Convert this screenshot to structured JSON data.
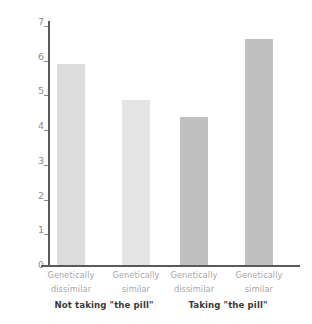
{
  "chart_data": {
    "type": "bar",
    "title": "",
    "xlabel": "",
    "ylabel": "Rated attractiveness of male odors",
    "ylim": [
      0,
      7
    ],
    "yticks": [
      "0",
      "1",
      "2",
      "3",
      "4",
      "5",
      "6",
      "7"
    ],
    "grid": false,
    "legend": "none",
    "categories": [
      "Genetically dissimilar",
      "Genetically similar",
      "Genetically dissimilar",
      "Genetically similar"
    ],
    "values": [
      5.8,
      4.75,
      4.25,
      6.5
    ],
    "bar_colors": [
      "#dcdcdc",
      "#e4e4e4",
      "#c0c0c0",
      "#c0c0c0"
    ],
    "groups": [
      {
        "label": "Not taking \"the pill\"",
        "categories": [
          "Genetically dissimilar",
          "Genetically similar"
        ]
      },
      {
        "label": "Taking \"the pill\"",
        "categories": [
          "Genetically dissimilar",
          "Genetically similar"
        ]
      }
    ]
  },
  "axis": {
    "y_label": "Rated attractiveness of male odors",
    "ticks": [
      "7",
      "6",
      "5",
      "4",
      "3",
      "2",
      "1",
      "0"
    ]
  },
  "categories": [
    {
      "line1": "Genetically",
      "line2": "dissimilar"
    },
    {
      "line1": "Genetically",
      "line2": "similar"
    },
    {
      "line1": "Genetically",
      "line2": "dissimilar"
    },
    {
      "line1": "Genetically",
      "line2": "similar"
    }
  ],
  "groups": [
    {
      "label": "Not taking \"the pill\""
    },
    {
      "label": "Taking \"the pill\""
    }
  ]
}
